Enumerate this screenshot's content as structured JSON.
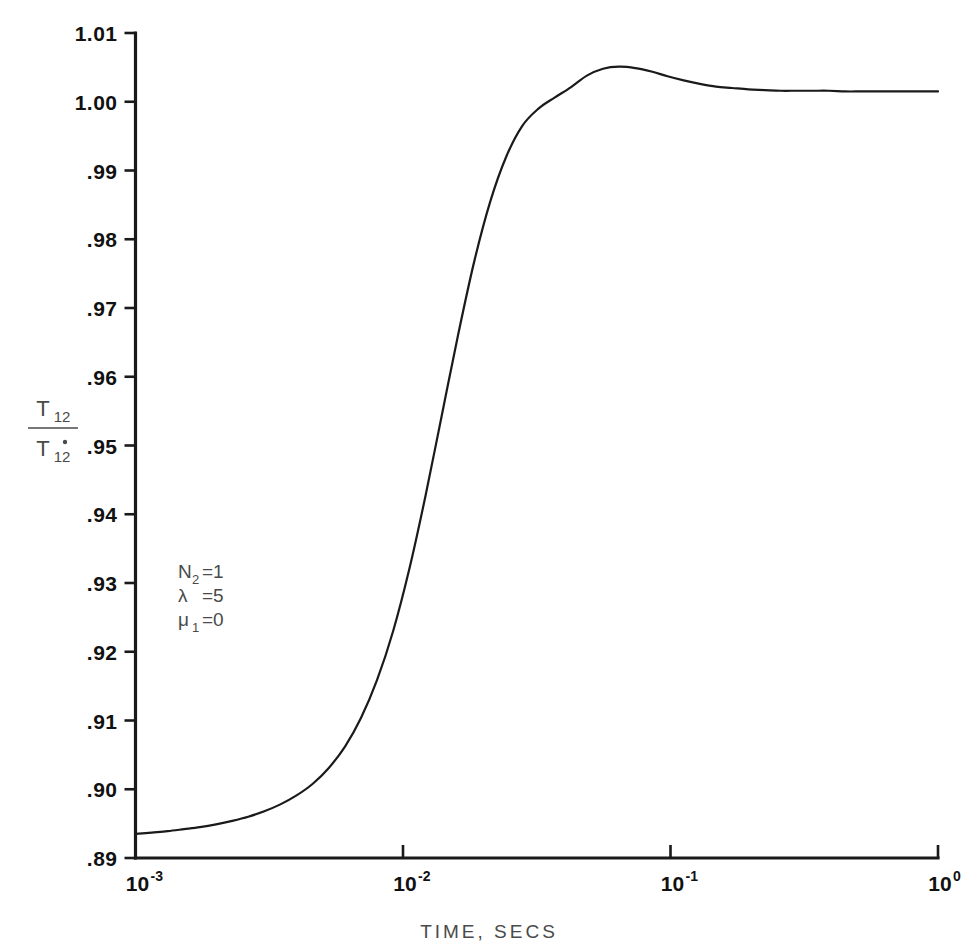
{
  "chart_data": {
    "type": "line",
    "title": "",
    "xlabel": "TIME, SECS",
    "ylabel": "T12 / T12-dot",
    "ylabel_numerator": "T",
    "ylabel_numerator_sub": "12",
    "ylabel_denominator": "T",
    "ylabel_denominator_sub": "12",
    "xscale": "log",
    "xlim": [
      0.001,
      1.0
    ],
    "ylim": [
      0.89,
      1.01
    ],
    "grid": false,
    "legend": "none",
    "xtick_labels": [
      "10⁻³",
      "10⁻²",
      "10⁻¹",
      "10⁰"
    ],
    "xticks": [
      {
        "base": "10",
        "exp": "-3",
        "value": 0.001
      },
      {
        "base": "10",
        "exp": "-2",
        "value": 0.01
      },
      {
        "base": "10",
        "exp": "-1",
        "value": 0.1
      },
      {
        "base": "10",
        "exp": "0",
        "value": 1.0
      }
    ],
    "ytick_labels": [
      "1.01",
      "1.00",
      ".99",
      ".98",
      ".97",
      ".96",
      ".95",
      ".94",
      ".93",
      ".92",
      ".91",
      ".90",
      ".89"
    ],
    "yticks": [
      1.01,
      1.0,
      0.99,
      0.98,
      0.97,
      0.96,
      0.95,
      0.94,
      0.93,
      0.92,
      0.91,
      0.9,
      0.89
    ],
    "annotations": [
      {
        "symbol": "N",
        "sub": "2",
        "rest": "=1"
      },
      {
        "symbol": "λ",
        "sub": "",
        "rest": "=5"
      },
      {
        "symbol": "μ",
        "sub": "1",
        "rest": "=0"
      }
    ],
    "series": [
      {
        "name": "T12 ratio",
        "color": "#1a1a1a",
        "x": [
          0.001,
          0.00115,
          0.00132,
          0.00152,
          0.00174,
          0.002,
          0.0023,
          0.00264,
          0.00303,
          0.00348,
          0.004,
          0.0046,
          0.00528,
          0.00607,
          0.00697,
          0.008,
          0.0092,
          0.01057,
          0.01214,
          0.01395,
          0.01603,
          0.01842,
          0.02116,
          0.02431,
          0.02793,
          0.0321,
          0.03687,
          0.04237,
          0.04868,
          0.05594,
          0.06428,
          0.07385,
          0.08485,
          0.0975,
          0.112,
          0.1287,
          0.1479,
          0.1699,
          0.1953,
          0.2244,
          0.2578,
          0.2963,
          0.3405,
          0.3912,
          0.4495,
          0.5165,
          0.5935,
          0.682,
          0.7836,
          0.9004,
          1.0
        ],
        "y": [
          0.8935,
          0.8937,
          0.8939,
          0.8942,
          0.8945,
          0.8949,
          0.8954,
          0.896,
          0.8968,
          0.8978,
          0.8991,
          0.9008,
          0.9031,
          0.9062,
          0.9104,
          0.9159,
          0.9231,
          0.9321,
          0.9427,
          0.9543,
          0.9659,
          0.9766,
          0.9854,
          0.992,
          0.9965,
          0.999,
          1.0006,
          1.0021,
          1.0038,
          1.0048,
          1.0051,
          1.0049,
          1.0044,
          1.0037,
          1.0031,
          1.0026,
          1.0022,
          1.002,
          1.0018,
          1.0017,
          1.0016,
          1.0016,
          1.0016,
          1.0016,
          1.0015,
          1.0015,
          1.0015,
          1.0015,
          1.0015,
          1.0015,
          1.0015
        ]
      }
    ],
    "key_points": {
      "start_value": 0.8935,
      "peak_value": 1.0051,
      "peak_time": 0.0643,
      "end_value": 1.0015
    }
  }
}
